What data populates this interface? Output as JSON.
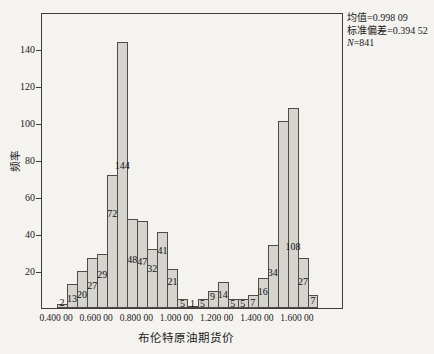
{
  "figure": {
    "background": "#f4f3ef",
    "bar_fill": "#d5d4cf",
    "bar_border": "#4f4b45",
    "axis_color": "#3c3c3c",
    "text_color": "#1a1a1a"
  },
  "stats": {
    "mean": "均值=0.998 09",
    "std": "标准偏差=0.394 52",
    "n_label": "N",
    "n_value": "=841"
  },
  "chart_data": {
    "type": "bar",
    "subtype": "histogram",
    "title": "",
    "xlabel": "布伦特原油期货价",
    "ylabel": "频率",
    "bin_start": 0.4,
    "bin_width": 0.05,
    "ylim": [
      0,
      160
    ],
    "y_ticks": [
      20,
      40,
      60,
      80,
      100,
      120,
      140
    ],
    "x_tick_labels": [
      "0.400 00",
      "0.600 00",
      "0.800 00",
      "1.000 00",
      "1.200 00",
      "1.400 00",
      "1.600 00"
    ],
    "x_tick_bin_index": [
      0,
      4,
      8,
      12,
      16,
      20,
      24
    ],
    "grid": false,
    "legend": null,
    "annotations": [
      "均值=0.998 09",
      "标准偏差=0.394 52",
      "N=841"
    ],
    "bars": [
      {
        "value": 2,
        "label": "2",
        "label_v": 4
      },
      {
        "value": 13,
        "label": "13",
        "label_v": 6
      },
      {
        "value": 20,
        "label": "20",
        "label_v": 8
      },
      {
        "value": 27,
        "label": "27",
        "label_v": 13
      },
      {
        "value": 29,
        "label": "29",
        "label_v": 19
      },
      {
        "value": 72,
        "label": "72",
        "label_v": 52
      },
      {
        "value": 144,
        "label": "144",
        "label_v": 78
      },
      {
        "value": 48,
        "label": "48",
        "label_v": 27
      },
      {
        "value": 47,
        "label": "47",
        "label_v": 26
      },
      {
        "value": 32,
        "label": "32",
        "label_v": 22
      },
      {
        "value": 41,
        "label": "41",
        "label_v": 32
      },
      {
        "value": 21,
        "label": "21",
        "label_v": 15
      },
      {
        "value": 5,
        "label": "5",
        "label_v": 3
      },
      {
        "value": 1,
        "label": "1",
        "label_v": 3
      },
      {
        "value": 5,
        "label": "5",
        "label_v": 3
      },
      {
        "value": 9,
        "label": "9",
        "label_v": 7
      },
      {
        "value": 14,
        "label": "14",
        "label_v": 8
      },
      {
        "value": 5,
        "label": "5",
        "label_v": 3
      },
      {
        "value": 5,
        "label": "5",
        "label_v": 3
      },
      {
        "value": 7,
        "label": "7",
        "label_v": 4
      },
      {
        "value": 16,
        "label": "16",
        "label_v": 10
      },
      {
        "value": 34,
        "label": "34",
        "label_v": 20
      },
      {
        "value": 101,
        "label": "",
        "label_v": 0
      },
      {
        "value": 108,
        "label": "108",
        "label_v": 34
      },
      {
        "value": 27,
        "label": "27",
        "label_v": 15
      },
      {
        "value": 7,
        "label": "7",
        "label_v": 5
      }
    ]
  }
}
